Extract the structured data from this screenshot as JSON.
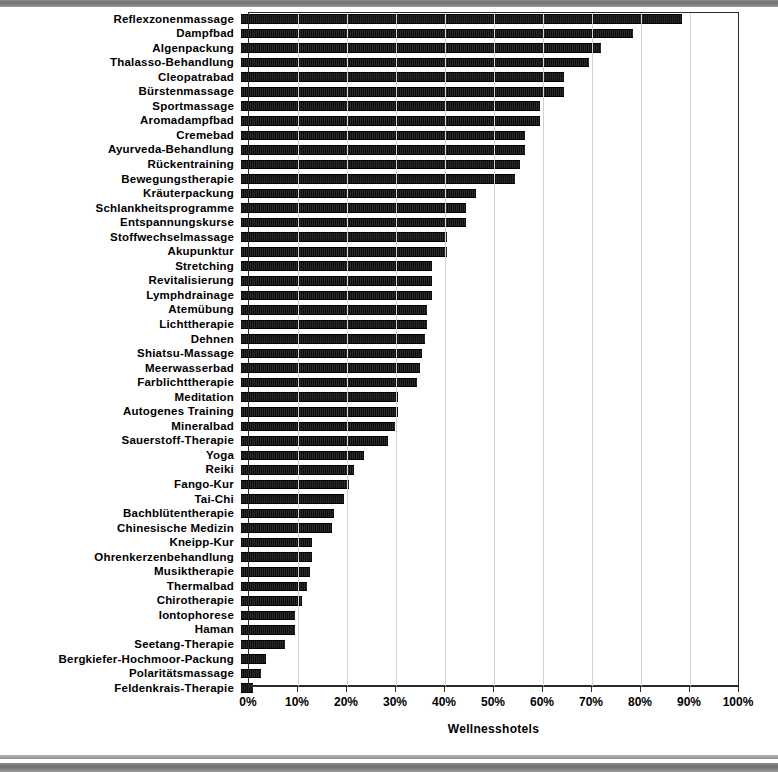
{
  "chart_data": {
    "type": "bar",
    "orientation": "horizontal",
    "title": "",
    "xlabel": "Wellnesshotels",
    "ylabel": "",
    "xlim": [
      0,
      100
    ],
    "xtick_labels": [
      "0%",
      "10%",
      "20%",
      "30%",
      "40%",
      "50%",
      "60%",
      "70%",
      "80%",
      "90%",
      "100%"
    ],
    "xtick_values": [
      0,
      10,
      20,
      30,
      40,
      50,
      60,
      70,
      80,
      90,
      100
    ],
    "grid": true,
    "legend": false,
    "unit": "%",
    "categories": [
      "Reflexzonenmassage",
      "Dampfbad",
      "Algenpackung",
      "Thalasso-Behandlung",
      "Cleopatrabad",
      "Bürstenmassage",
      "Sportmassage",
      "Aromadampfbad",
      "Cremebad",
      "Ayurveda-Behandlung",
      "Rückentraining",
      "Bewegungstherapie",
      "Kräuterpackung",
      "Schlankheitsprogramme",
      "Entspannungskurse",
      "Stoffwechselmassage",
      "Akupunktur",
      "Stretching",
      "Revitalisierung",
      "Lymphdrainage",
      "Atemübung",
      "Lichttherapie",
      "Dehnen",
      "Shiatsu-Massage",
      "Meerwasserbad",
      "Farblichttherapie",
      "Meditation",
      "Autogenes Training",
      "Mineralbad",
      "Sauerstoff-Therapie",
      "Yoga",
      "Reiki",
      "Fango-Kur",
      "Tai-Chi",
      "Bachblütentherapie",
      "Chinesische Medizin",
      "Kneipp-Kur",
      "Ohrenkerzenbehandlung",
      "Musiktherapie",
      "Thermalbad",
      "Chirotherapie",
      "Iontophorese",
      "Haman",
      "Seetang-Therapie",
      "Bergkiefer-Hochmoor-Packung",
      "Polaritätsmassage",
      "Feldenkrais-Therapie"
    ],
    "values": [
      90,
      80,
      73.5,
      71,
      66,
      66,
      61,
      61,
      58,
      58,
      57,
      56,
      48,
      46,
      46,
      42,
      42,
      39,
      39,
      39,
      38,
      38,
      37.5,
      37,
      36.5,
      36,
      32,
      32,
      31.5,
      30,
      25,
      23,
      22,
      21,
      19,
      18.5,
      14.5,
      14.5,
      14,
      13.5,
      12.5,
      11,
      11,
      9,
      5,
      4,
      2.5
    ]
  },
  "colors": {
    "bar": "#141414",
    "grid": "#d2d2d2",
    "axis": "#2b2b2b",
    "background": "#ffffff",
    "text": "#000000"
  }
}
